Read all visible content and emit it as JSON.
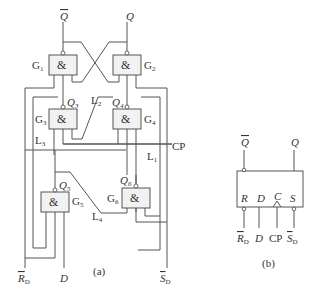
{
  "figure_a": {
    "caption": "(a)",
    "outputs": {
      "qbar": "Q",
      "q": "Q"
    },
    "gates": [
      {
        "id": "G1",
        "label": "G",
        "sub": "1",
        "symbol": "&"
      },
      {
        "id": "G2",
        "label": "G",
        "sub": "2",
        "symbol": "&"
      },
      {
        "id": "G3",
        "label": "G",
        "sub": "3",
        "symbol": "&",
        "out": "Q",
        "out_sub": "3"
      },
      {
        "id": "G4",
        "label": "G",
        "sub": "4",
        "symbol": "&",
        "out": "Q",
        "out_sub": "4"
      },
      {
        "id": "G5",
        "label": "G",
        "sub": "5",
        "symbol": "&",
        "out": "Q",
        "out_sub": "5"
      },
      {
        "id": "G6",
        "label": "G",
        "sub": "6",
        "symbol": "&",
        "out": "Q",
        "out_sub": "6"
      }
    ],
    "lines": [
      {
        "label": "L",
        "sub": "1"
      },
      {
        "label": "L",
        "sub": "2"
      },
      {
        "label": "L",
        "sub": "3"
      },
      {
        "label": "L",
        "sub": "4"
      }
    ],
    "inputs": {
      "rd": {
        "label": "R",
        "sub": "D"
      },
      "d": {
        "label": "D"
      },
      "sd": {
        "label": "S",
        "sub": "D"
      },
      "cp": {
        "label": "CP"
      }
    }
  },
  "figure_b": {
    "caption": "(b)",
    "outputs": {
      "qbar": "Q",
      "q": "Q"
    },
    "pins": {
      "r": "R",
      "d": "D",
      "c": "C",
      "s": "S"
    },
    "inputs": {
      "rd": {
        "label": "R",
        "sub": "D"
      },
      "d": {
        "label": "D"
      },
      "cp": {
        "label": "CP"
      },
      "sd": {
        "label": "S",
        "sub": "D"
      }
    }
  }
}
